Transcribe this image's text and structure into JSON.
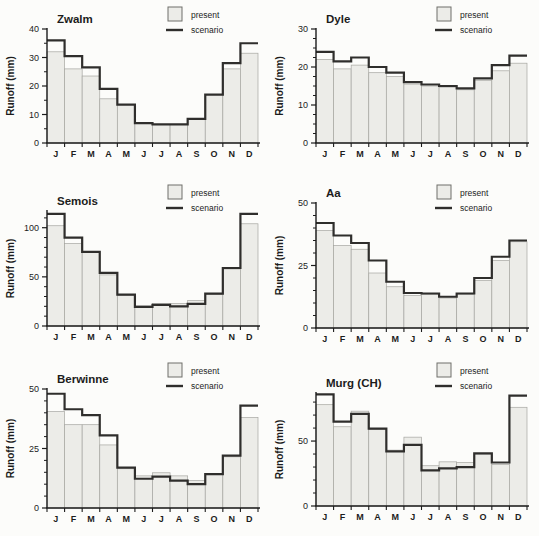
{
  "figure": {
    "ylabel": "Runoff (mm)",
    "months": [
      "J",
      "F",
      "M",
      "A",
      "M",
      "J",
      "J",
      "A",
      "S",
      "O",
      "N",
      "D"
    ],
    "legend": {
      "present_label": "present",
      "scenario_label": "scenario"
    },
    "colors": {
      "paper": "#fcfcfa",
      "bar_fill": "#ecece8",
      "bar_stroke": "#a6a6a1",
      "scenario_line": "#2f2e2c",
      "axis": "#1c1c1c",
      "text": "#1c1c1c"
    }
  },
  "chart_data": [
    {
      "type": "bar",
      "title": "Zwalm",
      "categories": [
        "J",
        "F",
        "M",
        "A",
        "M",
        "J",
        "J",
        "A",
        "S",
        "O",
        "N",
        "D"
      ],
      "series": [
        {
          "name": "present",
          "values": [
            32,
            26,
            23.5,
            15.5,
            13.5,
            7,
            6.5,
            6.5,
            8.5,
            17,
            26,
            31.5
          ]
        },
        {
          "name": "scenario",
          "values": [
            36,
            30.5,
            26.5,
            19,
            13.5,
            7,
            6.5,
            6.5,
            8.5,
            17,
            28,
            35
          ]
        }
      ],
      "ylabel": "Runoff (mm)",
      "xlabel": "",
      "ylim": [
        0,
        40
      ],
      "yticks": [
        0,
        10,
        20,
        30,
        40
      ],
      "yminor": 5,
      "grid": false,
      "legend_position": "top-right"
    },
    {
      "type": "bar",
      "title": "Dyle",
      "categories": [
        "J",
        "F",
        "M",
        "A",
        "M",
        "J",
        "J",
        "A",
        "S",
        "O",
        "N",
        "D"
      ],
      "series": [
        {
          "name": "present",
          "values": [
            22,
            19.5,
            20.5,
            18.5,
            17.5,
            15.5,
            15,
            14.7,
            14,
            16.5,
            19,
            21
          ]
        },
        {
          "name": "scenario",
          "values": [
            24,
            21.5,
            22.5,
            20,
            18.5,
            16,
            15.4,
            15,
            14.4,
            17,
            20.5,
            23
          ]
        }
      ],
      "ylabel": "Runoff (mm)",
      "xlabel": "",
      "ylim": [
        0,
        30
      ],
      "yticks": [
        0,
        10,
        20,
        30
      ],
      "yminor": 2.5,
      "grid": false,
      "legend_position": "top-right"
    },
    {
      "type": "bar",
      "title": "Semois",
      "categories": [
        "J",
        "F",
        "M",
        "A",
        "M",
        "J",
        "J",
        "A",
        "S",
        "O",
        "N",
        "D"
      ],
      "series": [
        {
          "name": "present",
          "values": [
            102,
            84,
            75,
            52,
            31,
            20.5,
            23,
            23,
            26,
            32,
            58,
            104
          ]
        },
        {
          "name": "scenario",
          "values": [
            114,
            90,
            75.5,
            54,
            32,
            19.5,
            21.5,
            20,
            22.5,
            33,
            59,
            114
          ]
        }
      ],
      "ylabel": "Runoff (mm)",
      "xlabel": "",
      "ylim": [
        0,
        117
      ],
      "yticks": [
        0,
        50,
        100
      ],
      "yminor": 10,
      "grid": false,
      "legend_position": "top-right"
    },
    {
      "type": "bar",
      "title": "Aa",
      "categories": [
        "J",
        "F",
        "M",
        "A",
        "M",
        "J",
        "J",
        "A",
        "S",
        "O",
        "N",
        "D"
      ],
      "series": [
        {
          "name": "present",
          "values": [
            39,
            33,
            31.5,
            22,
            16.5,
            13,
            13.5,
            12,
            13.5,
            19,
            27,
            34.5
          ]
        },
        {
          "name": "scenario",
          "values": [
            42,
            37,
            34,
            27,
            18.5,
            14,
            13.8,
            12.5,
            13.8,
            20,
            28.5,
            35
          ]
        }
      ],
      "ylabel": "Runoff (mm)",
      "xlabel": "",
      "ylim": [
        0,
        50
      ],
      "yticks": [
        0,
        25,
        50
      ],
      "yminor": 5,
      "grid": false,
      "legend_position": "top-right"
    },
    {
      "type": "bar",
      "title": "Berwinne",
      "categories": [
        "J",
        "F",
        "M",
        "A",
        "M",
        "J",
        "J",
        "A",
        "S",
        "O",
        "N",
        "D"
      ],
      "series": [
        {
          "name": "present",
          "values": [
            40.5,
            35,
            35,
            26.5,
            16.5,
            13.5,
            14.8,
            13.5,
            11.5,
            14,
            21.5,
            38
          ]
        },
        {
          "name": "scenario",
          "values": [
            48,
            41.5,
            39,
            30.5,
            17,
            12.3,
            13.2,
            11.5,
            10,
            14.2,
            22,
            43
          ]
        }
      ],
      "ylabel": "Runoff (mm)",
      "xlabel": "",
      "ylim": [
        0,
        50
      ],
      "yticks": [
        0,
        25,
        50
      ],
      "yminor": 5,
      "grid": false,
      "legend_position": "top-right"
    },
    {
      "type": "bar",
      "title": "Murg (CH)",
      "categories": [
        "J",
        "F",
        "M",
        "A",
        "M",
        "J",
        "J",
        "A",
        "S",
        "O",
        "N",
        "D"
      ],
      "series": [
        {
          "name": "present",
          "values": [
            78,
            61,
            73,
            59,
            43,
            53,
            31,
            34,
            33.5,
            40,
            32,
            76
          ]
        },
        {
          "name": "scenario",
          "values": [
            86,
            65,
            71,
            59.5,
            42,
            47,
            27.5,
            29,
            30,
            40.5,
            33.5,
            85
          ]
        }
      ],
      "ylabel": "Runoff (mm)",
      "xlabel": "",
      "ylim": [
        0,
        87
      ],
      "yticks": [
        0,
        50
      ],
      "yminor": 10,
      "grid": false,
      "legend_position": "top-right"
    }
  ]
}
